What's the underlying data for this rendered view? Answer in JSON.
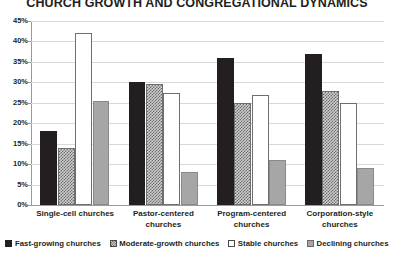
{
  "chart_data": {
    "type": "bar",
    "title": "CHURCH GROWTH AND CONGREGATIONAL DYNAMICS",
    "xlabel": "",
    "ylabel": "",
    "ylim": [
      0,
      45
    ],
    "ytick_step": 5,
    "ytick_labels": [
      "45%",
      "40%",
      "35%",
      "30%",
      "25%",
      "20%",
      "15%",
      "10%",
      "5%",
      "0%"
    ],
    "grid": true,
    "legend_position": "bottom",
    "categories": [
      "Single-cell churches",
      "Pastor-centered churches",
      "Program-centered churches",
      "Corporation-style churches"
    ],
    "series": [
      {
        "name": "Fast-growing churches",
        "values": [
          18.0,
          30.0,
          36.0,
          37.0
        ],
        "swatch_class": "sw-fast",
        "bar_class": "bar-fast"
      },
      {
        "name": "Moderate-growth churches",
        "values": [
          14.0,
          29.5,
          25.0,
          28.0
        ],
        "swatch_class": "sw-moderate",
        "bar_class": "bar-moderate"
      },
      {
        "name": "Stable churches",
        "values": [
          42.0,
          27.5,
          27.0,
          25.0
        ],
        "swatch_class": "sw-stable",
        "bar_class": "bar-stable"
      },
      {
        "name": "Declining churches",
        "values": [
          25.5,
          8.0,
          11.0,
          9.0
        ],
        "swatch_class": "sw-declining",
        "bar_class": "bar-declining"
      }
    ],
    "colors": {
      "fast_growing": "#231f20",
      "moderate_growth": "#cfcfcf",
      "stable": "#ffffff",
      "declining": "#a6a6a6",
      "gridline": "#d9d9d9",
      "axis": "#9a9a9a",
      "text": "#231f20",
      "background": "#ffffff"
    }
  }
}
